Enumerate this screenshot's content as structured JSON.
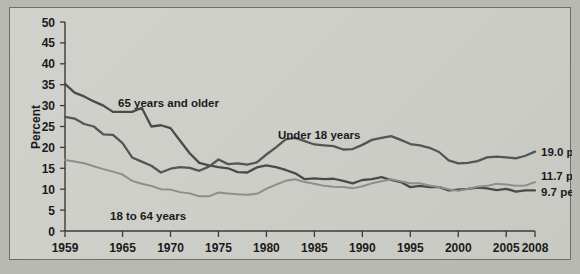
{
  "chart_data": {
    "type": "line",
    "title": "",
    "xlabel": "",
    "ylabel": "Percent",
    "xlim": [
      1959,
      2008
    ],
    "ylim": [
      0,
      50
    ],
    "grid": false,
    "legend_position": "inline-annotations",
    "xticks": [
      "1959",
      "1965",
      "1970",
      "1975",
      "1980",
      "1985",
      "1990",
      "1995",
      "2000",
      "2005",
      "2008"
    ],
    "xtick_values": [
      1959,
      1965,
      1970,
      1975,
      1980,
      1985,
      1990,
      1995,
      2000,
      2005,
      2008
    ],
    "yticks": [
      "0",
      "5",
      "10",
      "15",
      "20",
      "25",
      "30",
      "35",
      "40",
      "45",
      "50"
    ],
    "ytick_values": [
      0,
      5,
      10,
      15,
      20,
      25,
      30,
      35,
      40,
      45,
      50
    ],
    "x": [
      1959,
      1960,
      1961,
      1962,
      1963,
      1964,
      1965,
      1966,
      1967,
      1968,
      1969,
      1970,
      1971,
      1972,
      1973,
      1974,
      1975,
      1976,
      1977,
      1978,
      1979,
      1980,
      1981,
      1982,
      1983,
      1984,
      1985,
      1986,
      1987,
      1988,
      1989,
      1990,
      1991,
      1992,
      1993,
      1994,
      1995,
      1996,
      1997,
      1998,
      1999,
      2000,
      2001,
      2002,
      2003,
      2004,
      2005,
      2006,
      2007,
      2008
    ],
    "series": [
      {
        "name": "65 years and older",
        "color": "#4a4a48",
        "label_text": "65 years and older",
        "end_label": "9.7 percent",
        "end_value": 9.7,
        "values": [
          35.2,
          33.1,
          32.2,
          31.0,
          30.0,
          28.5,
          28.5,
          28.5,
          29.5,
          25.0,
          25.3,
          24.6,
          21.6,
          18.6,
          16.3,
          15.7,
          15.3,
          15.0,
          14.1,
          14.0,
          15.2,
          15.7,
          15.3,
          14.6,
          13.8,
          12.4,
          12.6,
          12.4,
          12.5,
          12.0,
          11.4,
          12.2,
          12.4,
          12.9,
          12.2,
          11.7,
          10.5,
          10.8,
          10.5,
          10.5,
          9.7,
          9.9,
          10.1,
          10.4,
          10.2,
          9.8,
          10.1,
          9.4,
          9.7,
          9.7
        ]
      },
      {
        "name": "Under 18 years",
        "color": "#555553",
        "label_text": "Under 18 years",
        "end_label": "19.0 percent",
        "end_value": 19.0,
        "values": [
          27.3,
          26.9,
          25.6,
          25.0,
          23.1,
          23.0,
          21.0,
          17.6,
          16.6,
          15.6,
          14.0,
          14.9,
          15.3,
          15.1,
          14.4,
          15.4,
          17.1,
          16.0,
          16.2,
          15.9,
          16.4,
          18.3,
          20.0,
          21.9,
          22.3,
          21.5,
          20.7,
          20.5,
          20.3,
          19.5,
          19.6,
          20.6,
          21.8,
          22.3,
          22.7,
          21.8,
          20.8,
          20.5,
          19.9,
          18.9,
          16.9,
          16.2,
          16.3,
          16.7,
          17.6,
          17.8,
          17.6,
          17.4,
          18.0,
          19.0
        ]
      },
      {
        "name": "18 to 64 years",
        "color": "#8e8e8a",
        "label_text": "18 to 64 years",
        "end_label": "11.7 percent",
        "end_value": 11.7,
        "values": [
          17.0,
          16.6,
          16.2,
          15.5,
          14.8,
          14.2,
          13.5,
          12.0,
          11.3,
          10.8,
          10.0,
          9.9,
          9.3,
          9.0,
          8.3,
          8.3,
          9.2,
          9.0,
          8.8,
          8.7,
          8.9,
          10.1,
          11.1,
          12.0,
          12.4,
          11.7,
          11.3,
          10.8,
          10.6,
          10.5,
          10.2,
          10.7,
          11.4,
          11.9,
          12.4,
          11.9,
          11.4,
          11.4,
          10.9,
          10.5,
          10.0,
          9.6,
          10.1,
          10.6,
          10.8,
          11.3,
          11.1,
          10.8,
          10.9,
          11.7
        ]
      }
    ]
  },
  "annotations": {
    "y_axis_title": "Percent",
    "series_inline_labels": [
      "65 years and older",
      "Under 18 years",
      "18 to 64 years"
    ],
    "end_labels": [
      "19.0 percent",
      "11.7 percent",
      "9.7 percent"
    ]
  }
}
